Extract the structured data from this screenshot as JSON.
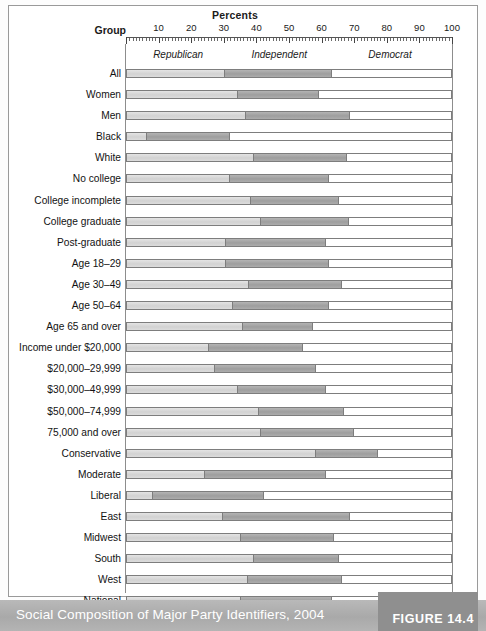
{
  "figure": {
    "axis_title": "Percents",
    "group_header": "Group",
    "caption": "Social Composition of Major Party Identifiers, 2004",
    "figure_number": "FIGURE 14.4"
  },
  "colors": {
    "republican": "#d2d2d2",
    "independent": "#9e9e9e",
    "democrat": "#ffffff",
    "caption_bar": "#b0b0b0",
    "figure_tab": "#8f8f8f",
    "outline": "#7d7d7d"
  },
  "chart_data": {
    "type": "bar",
    "orientation": "horizontal",
    "stacked": true,
    "percent": true,
    "title": "Social Composition of Major Party Identifiers, 2004",
    "xlabel": "Percents",
    "ylabel": "Group",
    "xlim": [
      0,
      100
    ],
    "xticks": [
      10,
      20,
      30,
      40,
      50,
      60,
      70,
      80,
      90,
      100
    ],
    "xtick_labels": [
      "10",
      "20",
      "30",
      "40",
      "50",
      "60",
      "70",
      "80",
      "90",
      "100"
    ],
    "grid": false,
    "legend_position": "top-inside",
    "legend": [
      "Republican",
      "Independent",
      "Democrat"
    ],
    "series": [
      {
        "name": "Republican",
        "color": "#d2d2d2",
        "values": [
          30,
          34,
          36.5,
          6,
          39,
          31.5,
          38,
          41,
          30.5,
          30.5,
          37.5,
          32.5,
          35.5,
          25,
          27,
          34,
          40.5,
          41,
          58,
          24,
          8,
          29.5,
          35,
          39,
          37,
          35
        ]
      },
      {
        "name": "Independent",
        "color": "#9e9e9e",
        "values": [
          33,
          25,
          32,
          25.5,
          28.5,
          30.5,
          27,
          27,
          30.5,
          31.5,
          28.5,
          29.5,
          21.5,
          29,
          31,
          27,
          26,
          28.5,
          19,
          37,
          34,
          39,
          28.5,
          26,
          29,
          28
        ]
      },
      {
        "name": "Democrat",
        "color": "#ffffff",
        "values": [
          37,
          41,
          31.5,
          68.5,
          32.5,
          38,
          35,
          32,
          39,
          38,
          34,
          38,
          43,
          46,
          42,
          39,
          33.5,
          30.5,
          23,
          39,
          58,
          31.5,
          36.5,
          35,
          34,
          37
        ]
      }
    ],
    "categories": [
      "All",
      "Women",
      "Men",
      "Black",
      "White",
      "No college",
      "College incomplete",
      "College graduate",
      "Post-graduate",
      "Age 18–29",
      "Age 30–49",
      "Age 50–64",
      "Age 65 and over",
      "Income under $20,000",
      "$20,000–29,999",
      "$30,000–49,999",
      "$50,000–74,999",
      "75,000 and over",
      "Conservative",
      "Moderate",
      "Liberal",
      "East",
      "Midwest",
      "South",
      "West",
      "National"
    ],
    "rows": [
      {
        "label": "All",
        "republican": 30,
        "independent": 33,
        "democrat": 37
      },
      {
        "label": "Women",
        "republican": 34,
        "independent": 25,
        "democrat": 41
      },
      {
        "label": "Men",
        "republican": 36.5,
        "independent": 32,
        "democrat": 31.5
      },
      {
        "label": "Black",
        "republican": 6,
        "independent": 25.5,
        "democrat": 68.5
      },
      {
        "label": "White",
        "republican": 39,
        "independent": 28.5,
        "democrat": 32.5
      },
      {
        "label": "No college",
        "republican": 31.5,
        "independent": 30.5,
        "democrat": 38
      },
      {
        "label": "College incomplete",
        "republican": 38,
        "independent": 27,
        "democrat": 35
      },
      {
        "label": "College graduate",
        "republican": 41,
        "independent": 27,
        "democrat": 32
      },
      {
        "label": "Post-graduate",
        "republican": 30.5,
        "independent": 30.5,
        "democrat": 39
      },
      {
        "label": "Age 18–29",
        "republican": 30.5,
        "independent": 31.5,
        "democrat": 38
      },
      {
        "label": "Age 30–49",
        "republican": 37.5,
        "independent": 28.5,
        "democrat": 34
      },
      {
        "label": "Age 50–64",
        "republican": 32.5,
        "independent": 29.5,
        "democrat": 38
      },
      {
        "label": "Age 65 and over",
        "republican": 35.5,
        "independent": 21.5,
        "democrat": 43
      },
      {
        "label": "Income under $20,000",
        "republican": 25,
        "independent": 29,
        "democrat": 46
      },
      {
        "label": "$20,000–29,999",
        "republican": 27,
        "independent": 31,
        "democrat": 42
      },
      {
        "label": "$30,000–49,999",
        "republican": 34,
        "independent": 27,
        "democrat": 39
      },
      {
        "label": "$50,000–74,999",
        "republican": 40.5,
        "independent": 26,
        "democrat": 33.5
      },
      {
        "label": "75,000 and over",
        "republican": 41,
        "independent": 28.5,
        "democrat": 30.5
      },
      {
        "label": "Conservative",
        "republican": 58,
        "independent": 19,
        "democrat": 23
      },
      {
        "label": "Moderate",
        "republican": 24,
        "independent": 37,
        "democrat": 39
      },
      {
        "label": "Liberal",
        "republican": 8,
        "independent": 34,
        "democrat": 58
      },
      {
        "label": "East",
        "republican": 29.5,
        "independent": 39,
        "democrat": 31.5
      },
      {
        "label": "Midwest",
        "republican": 35,
        "independent": 28.5,
        "democrat": 36.5
      },
      {
        "label": "South",
        "republican": 39,
        "independent": 26,
        "democrat": 35
      },
      {
        "label": "West",
        "republican": 37,
        "independent": 29,
        "democrat": 34
      },
      {
        "label": "National",
        "republican": 35,
        "independent": 28,
        "democrat": 37
      }
    ]
  }
}
